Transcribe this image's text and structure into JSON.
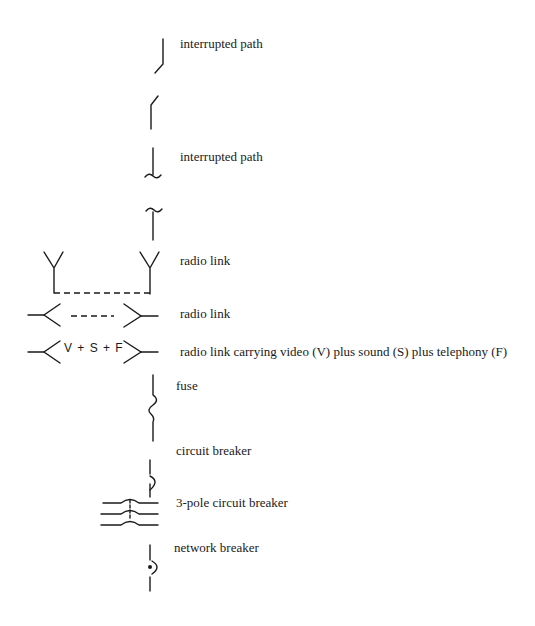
{
  "symbols": [
    {
      "id": "interrupted-path-1",
      "label": "interrupted path"
    },
    {
      "id": "interrupted-path-1-counterpart",
      "label": ""
    },
    {
      "id": "interrupted-path-2",
      "label": "interrupted path"
    },
    {
      "id": "interrupted-path-2-counterpart",
      "label": ""
    },
    {
      "id": "radio-link-antennas",
      "label": "radio link"
    },
    {
      "id": "radio-link-horizontal",
      "label": "radio link"
    },
    {
      "id": "radio-link-vsf",
      "label": "radio link carrying video (V) plus sound (S) plus telephony (F)",
      "inline_text": "V + S + F"
    },
    {
      "id": "fuse",
      "label": "fuse"
    },
    {
      "id": "circuit-breaker",
      "label": "circuit breaker"
    },
    {
      "id": "three-pole-circuit-breaker",
      "label": "3-pole circuit breaker"
    },
    {
      "id": "network-breaker",
      "label": "network breaker"
    }
  ]
}
